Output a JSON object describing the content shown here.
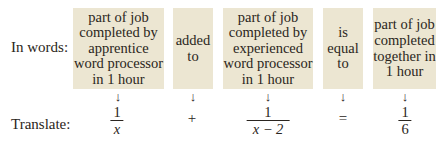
{
  "row_labels": {
    "words": "In words:",
    "translate": "Translate:"
  },
  "boxes": [
    {
      "text": "part of job\ncompleted by\napprentice\nword processor\nin 1 hour"
    },
    {
      "text": "added\nto"
    },
    {
      "text": "part of job\ncompleted by\nexperienced\nword processor\nin 1 hour"
    },
    {
      "text": "is\nequal\nto"
    },
    {
      "text": "part of job\ncompleted\ntogether in\n1 hour"
    }
  ],
  "arrow_glyph": "↓",
  "translation": [
    {
      "type": "fraction",
      "numerator": "1",
      "denominator": "x"
    },
    {
      "type": "operator",
      "symbol": "+"
    },
    {
      "type": "fraction",
      "numerator": "1",
      "denominator": "x − 2"
    },
    {
      "type": "operator",
      "symbol": "="
    },
    {
      "type": "fraction",
      "numerator": "1",
      "denominator": "6"
    }
  ],
  "colors": {
    "box_background": "#ece6d2",
    "text": "#2a2520"
  }
}
